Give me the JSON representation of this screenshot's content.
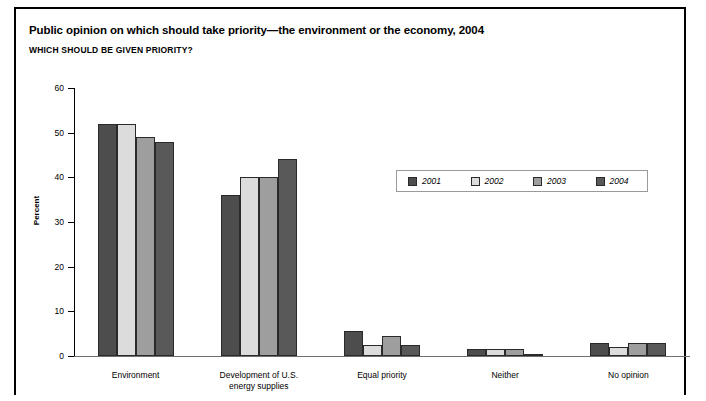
{
  "header": {
    "title": "Public opinion on which should take priority—the environment or the economy, 2004",
    "subtitle": "WHICH SHOULD BE GIVEN PRIORITY?"
  },
  "chart_data": {
    "type": "bar",
    "title": "Public opinion on which should take priority—the environment or the economy, 2004",
    "subtitle": "WHICH SHOULD BE GIVEN PRIORITY?",
    "xlabel": "",
    "ylabel": "Percent",
    "ylim": [
      0,
      60
    ],
    "ytick_labels": [
      "0",
      "10",
      "20",
      "30",
      "40",
      "50",
      "60"
    ],
    "yticks": [
      0,
      10,
      20,
      30,
      40,
      50,
      60
    ],
    "grid": false,
    "legend_position": "inside-upper-right",
    "categories": [
      "Environment",
      "Development of U.S.\nenergy supplies",
      "Equal priority",
      "Neither",
      "No opinion"
    ],
    "series": [
      {
        "name": "2001",
        "color": "#4d4d4d",
        "values": [
          52,
          36,
          5.5,
          1.5,
          3
        ]
      },
      {
        "name": "2002",
        "color": "#dcdcdc",
        "values": [
          52,
          40,
          2.5,
          1.5,
          2
        ]
      },
      {
        "name": "2003",
        "color": "#9e9e9e",
        "values": [
          49,
          40,
          4.5,
          1.5,
          3
        ]
      },
      {
        "name": "2004",
        "color": "#595959",
        "values": [
          48,
          44,
          2.5,
          0.5,
          3
        ]
      }
    ]
  }
}
